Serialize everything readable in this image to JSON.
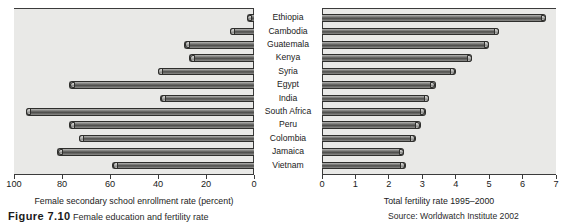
{
  "chart_data": {
    "type": "bar",
    "orientation": "horizontal-backtoback",
    "title": "",
    "categories": [
      "Ethiopia",
      "Cambodia",
      "Guatemala",
      "Kenya",
      "Syria",
      "Egypt",
      "India",
      "South Africa",
      "Peru",
      "Colombia",
      "Jamaica",
      "Vietnam"
    ],
    "series": [
      {
        "name": "Female secondary school enrollment rate (percent)",
        "panel": "left",
        "direction": "right-to-left",
        "values": [
          3,
          10,
          29,
          27,
          40,
          77,
          39,
          95,
          77,
          73,
          82,
          59
        ],
        "xlabel": "Female secondary school enrollment rate (percent)",
        "xlim": [
          100,
          0
        ],
        "ticks": [
          100,
          80,
          60,
          40,
          20,
          0
        ],
        "ticklabels": [
          "100",
          "80",
          "60",
          "40",
          "20",
          "0"
        ]
      },
      {
        "name": "Total fertility rate 1995-2000",
        "panel": "right",
        "direction": "left-to-right",
        "values": [
          6.7,
          5.3,
          5.0,
          4.5,
          4.0,
          3.4,
          3.2,
          3.1,
          2.95,
          2.8,
          2.45,
          2.5
        ],
        "xlabel": "Total fertility rate 1995–2000",
        "xlim": [
          0,
          7
        ],
        "ticks": [
          0,
          1,
          2,
          3,
          4,
          5,
          6,
          7
        ],
        "ticklabels": [
          "0",
          "1",
          "2",
          "3",
          "4",
          "5",
          "6",
          "7"
        ]
      }
    ],
    "grid": false,
    "legend": "none"
  },
  "axes": {
    "left": {
      "title": "Female secondary school enrollment rate (percent)",
      "ticklabels": [
        "100",
        "80",
        "60",
        "40",
        "20",
        "0"
      ]
    },
    "right": {
      "title": "Total fertility rate 1995–2000",
      "ticklabels": [
        "0",
        "1",
        "2",
        "3",
        "4",
        "5",
        "6",
        "7"
      ]
    }
  },
  "caption": {
    "figure_number": "Figure 7.10",
    "text": "Female education and fertility rate",
    "source": "Source: Worldwatch Institute 2002"
  }
}
